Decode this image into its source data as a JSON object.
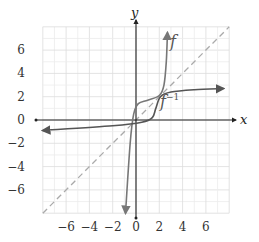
{
  "chart_data": {
    "type": "line",
    "title": "",
    "xlabel": "x",
    "ylabel": "y",
    "xlim": [
      -8,
      8
    ],
    "ylim": [
      -8,
      8
    ],
    "grid": true,
    "x_ticks": [
      -6,
      -4,
      -2,
      0,
      2,
      4,
      6
    ],
    "y_ticks": [
      6,
      4,
      2,
      0,
      -2,
      -4,
      -6
    ],
    "x_tick_labels": [
      "−6",
      "−4",
      "−2",
      "0",
      "2",
      "4",
      "6"
    ],
    "y_tick_labels": [
      "6",
      "4",
      "2",
      "0",
      "−2",
      "−4",
      "−6"
    ],
    "series": [
      {
        "name": "f",
        "label": "f",
        "style": "solid",
        "color": "#777777",
        "points": [
          [
            -0.9,
            -8
          ],
          [
            -0.5,
            -2
          ],
          [
            -0.2,
            0.5
          ],
          [
            0.2,
            1.4
          ],
          [
            1,
            1.7
          ],
          [
            2,
            2.1
          ],
          [
            2.4,
            3
          ],
          [
            2.6,
            5
          ],
          [
            2.7,
            7.5
          ]
        ]
      },
      {
        "name": "f_inverse",
        "label": "f⁻¹",
        "style": "solid",
        "color": "#555555",
        "points": [
          [
            -8,
            -0.9
          ],
          [
            -2,
            -0.5
          ],
          [
            0.5,
            -0.2
          ],
          [
            1.4,
            0.2
          ],
          [
            1.7,
            1
          ],
          [
            2.1,
            2
          ],
          [
            3,
            2.4
          ],
          [
            5,
            2.6
          ],
          [
            7.5,
            2.7
          ]
        ]
      },
      {
        "name": "y_equals_x",
        "label": "y = x",
        "style": "dashed",
        "color": "#aaaaaa",
        "points": [
          [
            -8,
            -8
          ],
          [
            8,
            8
          ]
        ]
      }
    ],
    "annotations": [
      {
        "text": "f",
        "x": 3.0,
        "y": 6.0
      },
      {
        "text": "f⁻¹",
        "x": 2.2,
        "y": 1.5
      }
    ]
  },
  "labels": {
    "x_axis": "x",
    "y_axis": "y",
    "f": "f",
    "f_inv_base": "f",
    "f_inv_sup": "−1"
  }
}
